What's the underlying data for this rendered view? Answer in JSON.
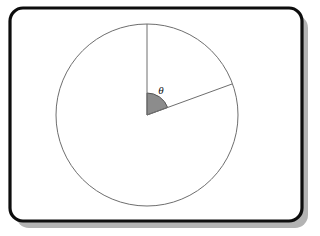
{
  "figure": {
    "canvas": {
      "width": 320,
      "height": 236,
      "background": "#ffffff"
    },
    "frame": {
      "name": "rounded-panel-frame",
      "x": 10,
      "y": 8,
      "width": 292,
      "height": 213,
      "corner_radius": 13,
      "border_color": "#0d0d0d",
      "border_width": 3.2,
      "fill": "#ffffff",
      "shadow_color": "#b3b3b3",
      "shadow_offset_x": 6,
      "shadow_offset_y": 7
    },
    "circle": {
      "name": "main-circle",
      "center_x": 147,
      "center_y": 115,
      "radius": 91,
      "stroke_color": "#6e6e6e",
      "stroke_width": 1,
      "fill": "none"
    },
    "radii": [
      {
        "name": "vertical-radius",
        "label": "initial side",
        "angle_degrees": 90,
        "from_x": 147,
        "from_y": 115,
        "to_x": 147,
        "to_y": 24,
        "stroke_color": "#6e6e6e",
        "stroke_width": 1
      },
      {
        "name": "terminal-radius",
        "label": "terminal side",
        "angle_degrees": 20,
        "from_x": 147,
        "from_y": 115,
        "to_x": 232,
        "to_y": 84,
        "stroke_color": "#6e6e6e",
        "stroke_width": 1
      }
    ],
    "angle_sector": {
      "name": "theta-sector",
      "start_angle_degrees": 20,
      "end_angle_degrees": 90,
      "sweep_degrees": 70,
      "arc_radius": 22,
      "fill_color": "#8c8c8c",
      "stroke_color": "#555555",
      "stroke_width": 1
    },
    "angle_label": {
      "name": "theta-label",
      "symbol": "θ",
      "x": 161,
      "y": 94,
      "color": "#111111",
      "font_size_px": 11,
      "style": "italic serif"
    }
  }
}
